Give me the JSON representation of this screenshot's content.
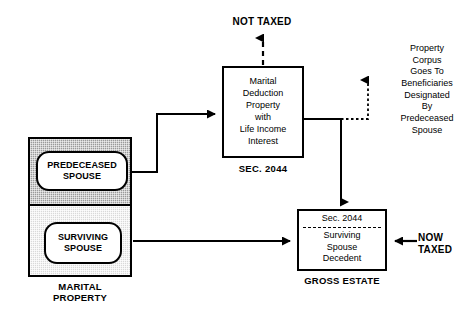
{
  "diagram": {
    "marital_property": {
      "group_label": "MARITAL\nPROPERTY",
      "predeceased_label": "PREDECEASED\nSPOUSE",
      "surviving_label": "SURVIVING\nSPOUSE",
      "predeceased_fill": "#9a9a9a",
      "surviving_fill": "#d9d9d9"
    },
    "marital_deduction": {
      "body": "Marital\nDeduction\nProperty\nwith\nLife Income\nInterest",
      "caption": "SEC. 2044"
    },
    "gross_estate": {
      "section_label": "Sec. 2044",
      "body": "Surviving\nSpouse\nDecedent",
      "caption": "GROSS ESTATE"
    },
    "annotations": {
      "not_taxed": "NOT TAXED",
      "now_taxed": "NOW\nTAXED",
      "beneficiaries_note": "Property\nCorpus\nGoes To\nBeneficiaries\nDesignated\nBy\nPredeceased\nSpouse"
    },
    "style": {
      "line_color": "#000000",
      "background": "#ffffff"
    }
  }
}
